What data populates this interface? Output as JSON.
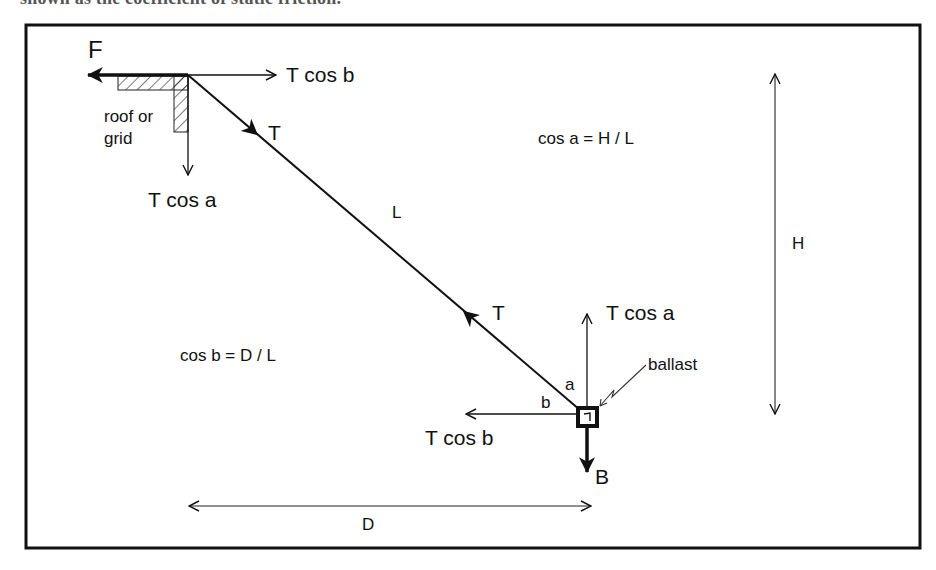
{
  "caption": "shown as the coefficient of static friction.",
  "figure": {
    "frame_color": "#111111",
    "labels": {
      "force_f": "F",
      "t_cos_b_top": "T cos b",
      "roof_line1": "roof or",
      "roof_line2": "grid",
      "t_top": "T",
      "t_cos_a_top": "T cos a",
      "rope_length": "L",
      "eq_cos_a": "cos a = H / L",
      "height": "H",
      "t_bottom": "T",
      "t_cos_a_bottom": "T cos a",
      "eq_cos_b": "cos b = D / L",
      "ballast": "ballast",
      "angle_a": "a",
      "angle_b": "b",
      "t_cos_b_bottom": "T cos b",
      "force_b": "B",
      "distance": "D"
    }
  }
}
